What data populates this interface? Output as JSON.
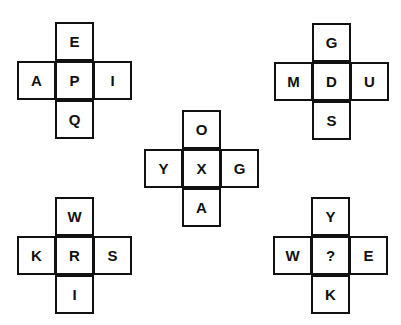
{
  "puzzle": {
    "crosses": [
      {
        "id": "top-left",
        "x": 17,
        "y": 22,
        "top": "E",
        "left": "A",
        "center": "P",
        "right": "I",
        "bottom": "Q"
      },
      {
        "id": "top-right",
        "x": 274,
        "y": 23,
        "top": "G",
        "left": "M",
        "center": "D",
        "right": "U",
        "bottom": "S"
      },
      {
        "id": "middle",
        "x": 144,
        "y": 110,
        "top": "O",
        "left": "Y",
        "center": "X",
        "right": "G",
        "bottom": "A"
      },
      {
        "id": "bottom-left",
        "x": 17,
        "y": 197,
        "top": "W",
        "left": "K",
        "center": "R",
        "right": "S",
        "bottom": "I"
      },
      {
        "id": "bottom-right",
        "x": 273,
        "y": 197,
        "top": "Y",
        "left": "W",
        "center": "?",
        "right": "E",
        "bottom": "K"
      }
    ]
  }
}
